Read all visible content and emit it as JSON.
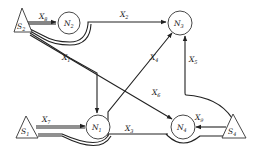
{
  "diagram": {
    "type": "flow-network",
    "nodes": [
      {
        "id": "S2",
        "kind": "source",
        "label": "S",
        "sub": "2"
      },
      {
        "id": "N2",
        "kind": "node",
        "label": "N",
        "sub": "2"
      },
      {
        "id": "N3",
        "kind": "node",
        "label": "N",
        "sub": "3"
      },
      {
        "id": "S1",
        "kind": "source",
        "label": "S",
        "sub": "1"
      },
      {
        "id": "N1",
        "kind": "node",
        "label": "N",
        "sub": "1"
      },
      {
        "id": "N4",
        "kind": "node",
        "label": "N",
        "sub": "4"
      },
      {
        "id": "S4",
        "kind": "source",
        "label": "S",
        "sub": "4"
      }
    ],
    "edges": [
      {
        "id": "X1",
        "label": "X",
        "sub": "1",
        "from": "S2",
        "to": "N1"
      },
      {
        "id": "X2",
        "label": "X",
        "sub": "2",
        "from": "N2",
        "to": "N3"
      },
      {
        "id": "X3",
        "label": "X",
        "sub": "3",
        "from": "N1",
        "to": "N4"
      },
      {
        "id": "X4",
        "label": "X",
        "sub": "4",
        "from": "N1",
        "to": "N3"
      },
      {
        "id": "X5",
        "label": "X",
        "sub": "5",
        "from": "S4",
        "to": "N3"
      },
      {
        "id": "X6",
        "label": "X",
        "sub": "6",
        "from": "S2",
        "to": "N4"
      },
      {
        "id": "X7",
        "label": "X",
        "sub": "7",
        "from": "S1",
        "to": "N1"
      },
      {
        "id": "X8",
        "label": "X",
        "sub": "8",
        "from": "S2",
        "to": "N2"
      },
      {
        "id": "X9",
        "label": "X",
        "sub": "9",
        "from": "S4",
        "to": "N4"
      }
    ]
  }
}
